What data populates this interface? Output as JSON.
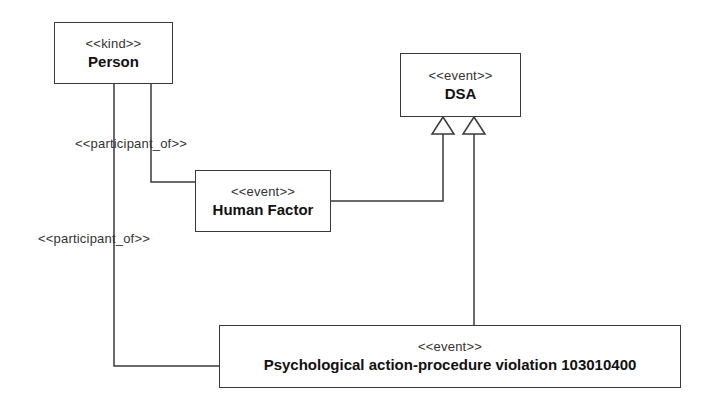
{
  "diagram": {
    "type": "UML class diagram",
    "classes": [
      {
        "id": "person",
        "stereotype": "<<kind>>",
        "name": "Person"
      },
      {
        "id": "dsa",
        "stereotype": "<<event>>",
        "name": "DSA"
      },
      {
        "id": "human_factor",
        "stereotype": "<<event>>",
        "name": "Human Factor"
      },
      {
        "id": "psych_violation",
        "stereotype": "<<event>>",
        "name": "Psychological action-procedure violation 103010400"
      }
    ],
    "relations": [
      {
        "type": "association",
        "label": "<<participant_of>>",
        "from": "person",
        "to": "human_factor"
      },
      {
        "type": "association",
        "label": "<<participant_of>>",
        "from": "person",
        "to": "psych_violation"
      },
      {
        "type": "generalization",
        "from": "human_factor",
        "to": "dsa"
      },
      {
        "type": "generalization",
        "from": "psych_violation",
        "to": "dsa"
      }
    ],
    "colors": {
      "line": "#3a3a3a",
      "background": "#ffffff",
      "text": "#1a1a1a"
    }
  }
}
